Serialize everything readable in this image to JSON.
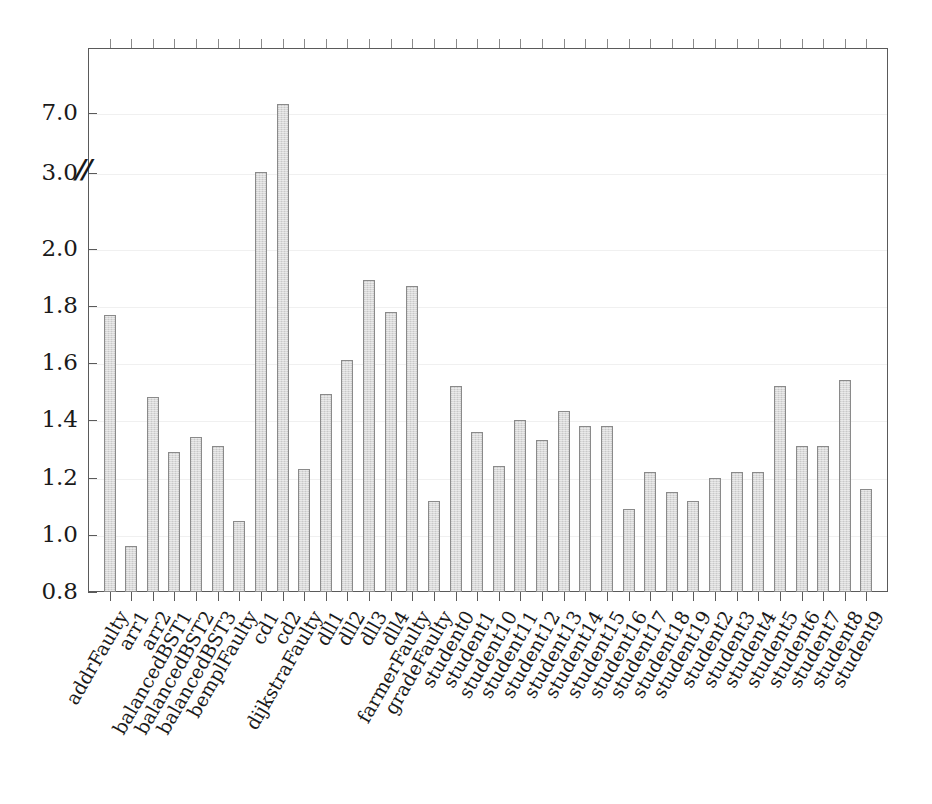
{
  "chart_data": {
    "type": "bar",
    "title": "",
    "xlabel": "",
    "ylabel": "",
    "ylim": [
      0.8,
      7.8
    ],
    "grid": true,
    "legend": "none",
    "axis_break": {
      "marker": "//",
      "at": 3.0,
      "note": "y-axis broken between 2.0 and 3.0; 3.0 and 7.0 ticks are compressed"
    },
    "ytick_labels": [
      "0.8",
      "1.0",
      "1.2",
      "1.4",
      "1.6",
      "1.8",
      "2.0",
      "3.0",
      "7.0"
    ],
    "yticks": [
      0.8,
      1.0,
      1.2,
      1.4,
      1.6,
      1.8,
      2.0,
      3.0,
      7.0
    ],
    "categories": [
      "addrFaulty",
      "arr1",
      "arr2",
      "balancedBST1",
      "balancedBST2",
      "balancedBST3",
      "bemplFaulty",
      "cd1",
      "cd2",
      "dijkstraFaulty",
      "dll1",
      "dll2",
      "dll3",
      "dll4",
      "farmerFaulty",
      "gradeFaulty",
      "student0",
      "student1",
      "student10",
      "student11",
      "student12",
      "student13",
      "student14",
      "student15",
      "student16",
      "student17",
      "student18",
      "student19",
      "student2",
      "student3",
      "student4",
      "student5",
      "student6",
      "student7",
      "student8",
      "student9"
    ],
    "values": [
      1.77,
      0.96,
      1.48,
      1.29,
      1.34,
      1.31,
      1.05,
      3.05,
      7.6,
      1.23,
      1.49,
      1.61,
      1.89,
      1.78,
      1.87,
      1.12,
      1.52,
      1.36,
      1.24,
      1.4,
      1.33,
      1.43,
      1.38,
      1.38,
      1.09,
      1.22,
      1.15,
      1.12,
      1.2,
      1.22,
      1.22,
      1.52,
      1.31,
      1.31,
      1.54,
      1.16
    ]
  },
  "colors": {
    "bar_fill": "#d9d9d9",
    "bar_edge": "#8a8a8a",
    "axis": "#5a5a5a",
    "grid": "#f0f0f0",
    "text": "#1a1a1a",
    "background": "#ffffff"
  }
}
